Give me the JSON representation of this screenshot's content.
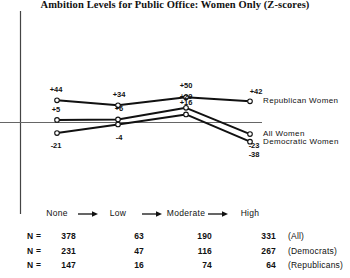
{
  "chart_data": {
    "type": "line",
    "title": "Ambition Levels for Public Office:  Women Only (Z-scores)",
    "xlabel": "",
    "ylabel": "",
    "categories": [
      "None",
      "Low",
      "Moderate",
      "High"
    ],
    "category_separator": "arrow-right-icon",
    "ylim": [
      -45,
      58
    ],
    "grid": false,
    "zero_line": true,
    "legend_position": "right-of-line-end",
    "series": [
      {
        "name": "Republican Women",
        "values": [
          44,
          34,
          50,
          42
        ],
        "labels": [
          "+44",
          "+34",
          "+50",
          "+42"
        ]
      },
      {
        "name": "All Women",
        "values": [
          5,
          6,
          29,
          -23
        ],
        "labels": [
          "+5",
          "+6",
          "+29",
          "-23"
        ]
      },
      {
        "name": "Democratic Women",
        "values": [
          -21,
          -4,
          16,
          -38
        ],
        "labels": [
          "-21",
          "-4",
          "+16",
          "-38"
        ]
      }
    ],
    "n_table": {
      "row_prefix": "N =",
      "rows": [
        {
          "values": [
            378,
            63,
            190,
            331
          ],
          "group": "(All)"
        },
        {
          "values": [
            231,
            47,
            116,
            267
          ],
          "group": "(Democrats)"
        },
        {
          "values": [
            147,
            16,
            74,
            64
          ],
          "group": "(Republicans)"
        }
      ]
    },
    "colors": {
      "line": "#111111",
      "marker_fill": "#ffffff",
      "axis": "#555555",
      "text": "#111111"
    }
  }
}
